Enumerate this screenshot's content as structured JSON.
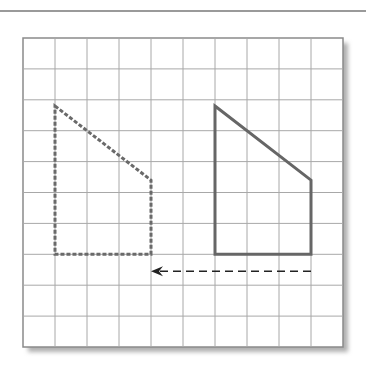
{
  "diagram": {
    "type": "coordinate-grid-translation",
    "grid": {
      "columns": 10,
      "rows": 10,
      "origin_px": [
        23,
        38
      ],
      "cell_w": 32,
      "cell_h": 30.9,
      "line_color": "#a8a8a8",
      "border_color": "#8a8a8a",
      "shadow_color": "#b5b5b5"
    },
    "shapes": [
      {
        "name": "preimage",
        "style": "solid",
        "color": "#666666",
        "vertices_grid": [
          [
            6,
            2.2
          ],
          [
            9,
            4.6
          ],
          [
            9,
            7
          ],
          [
            6,
            7
          ]
        ]
      },
      {
        "name": "image",
        "style": "dashed",
        "color": "#6a6a6a",
        "vertices_grid": [
          [
            1,
            2.2
          ],
          [
            4,
            4.6
          ],
          [
            4,
            7
          ],
          [
            1,
            7
          ]
        ]
      }
    ],
    "arrow": {
      "style": "dashed",
      "color": "#222222",
      "from_grid": [
        9,
        7.55
      ],
      "to_grid": [
        4,
        7.55
      ],
      "direction": "left",
      "units": 5
    },
    "header_rule_color": "#9a9a9a"
  }
}
